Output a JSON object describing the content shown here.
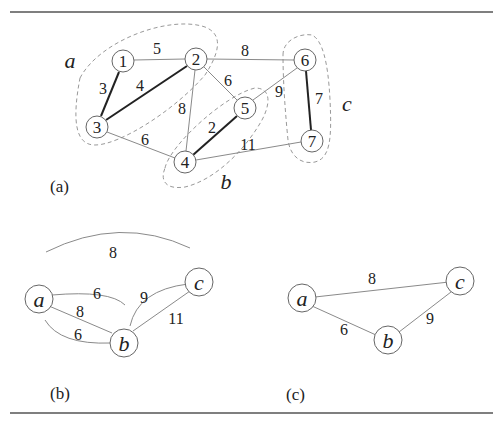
{
  "figure": {
    "panel_a": {
      "caption": "(a)",
      "nodes": [
        {
          "id": "1",
          "label": "1",
          "x": 123,
          "y": 61
        },
        {
          "id": "2",
          "label": "2",
          "x": 196,
          "y": 59
        },
        {
          "id": "3",
          "label": "3",
          "x": 97,
          "y": 127
        },
        {
          "id": "4",
          "label": "4",
          "x": 185,
          "y": 162
        },
        {
          "id": "5",
          "label": "5",
          "x": 245,
          "y": 108
        },
        {
          "id": "6",
          "label": "6",
          "x": 305,
          "y": 60
        },
        {
          "id": "7",
          "label": "7",
          "x": 312,
          "y": 141
        }
      ],
      "edges": [
        {
          "from": "1",
          "to": "2",
          "weight": "5",
          "bold": false
        },
        {
          "from": "1",
          "to": "3",
          "weight": "3",
          "bold": true
        },
        {
          "from": "2",
          "to": "3",
          "weight": "4",
          "bold": true
        },
        {
          "from": "2",
          "to": "6",
          "weight": "8",
          "bold": false
        },
        {
          "from": "2",
          "to": "5",
          "weight": "6",
          "bold": false
        },
        {
          "from": "2",
          "to": "4",
          "weight": "8",
          "bold": false
        },
        {
          "from": "3",
          "to": "4",
          "weight": "6",
          "bold": false
        },
        {
          "from": "4",
          "to": "5",
          "weight": "2",
          "bold": true
        },
        {
          "from": "5",
          "to": "6",
          "weight": "9",
          "bold": false
        },
        {
          "from": "4",
          "to": "7",
          "weight": "11",
          "bold": false
        },
        {
          "from": "6",
          "to": "7",
          "weight": "7",
          "bold": true
        }
      ],
      "clusters": [
        {
          "label": "a",
          "members": [
            "1",
            "2",
            "3"
          ]
        },
        {
          "label": "b",
          "members": [
            "4",
            "5"
          ]
        },
        {
          "label": "c",
          "members": [
            "6",
            "7"
          ]
        }
      ]
    },
    "panel_b": {
      "caption": "(b)",
      "nodes": [
        {
          "id": "a",
          "label": "a"
        },
        {
          "id": "b",
          "label": "b"
        },
        {
          "id": "c",
          "label": "c"
        }
      ],
      "edges": [
        {
          "from": "a",
          "to": "c",
          "weight": "8"
        },
        {
          "from": "a",
          "to": "b",
          "weight": "6"
        },
        {
          "from": "a",
          "to": "b",
          "weight": "8"
        },
        {
          "from": "a",
          "to": "b",
          "weight": "6"
        },
        {
          "from": "b",
          "to": "c",
          "weight": "9"
        },
        {
          "from": "b",
          "to": "c",
          "weight": "11"
        }
      ]
    },
    "panel_c": {
      "caption": "(c)",
      "nodes": [
        {
          "id": "a",
          "label": "a"
        },
        {
          "id": "b",
          "label": "b"
        },
        {
          "id": "c",
          "label": "c"
        }
      ],
      "edges": [
        {
          "from": "a",
          "to": "c",
          "weight": "8"
        },
        {
          "from": "a",
          "to": "b",
          "weight": "6"
        },
        {
          "from": "b",
          "to": "c",
          "weight": "9"
        }
      ]
    }
  }
}
